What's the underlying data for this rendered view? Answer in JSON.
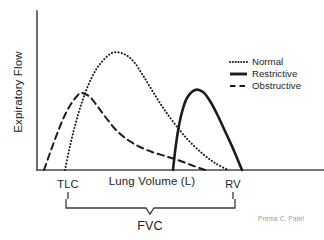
{
  "chart_data": {
    "type": "line",
    "title": "",
    "xlabel": "Lung Volume (L)",
    "ylabel": "Expiratory Flow",
    "grid": false,
    "legend_position": "top-right",
    "axis_tick_labels": [],
    "series": [
      {
        "name": "Normal",
        "style": "dotted",
        "color": "#1b1b1b",
        "points": [
          [
            65,
            170
          ],
          [
            70,
            146
          ],
          [
            76,
            122
          ],
          [
            83,
            99
          ],
          [
            91,
            79
          ],
          [
            100,
            64
          ],
          [
            112,
            53
          ],
          [
            124,
            54
          ],
          [
            134,
            62
          ],
          [
            144,
            77
          ],
          [
            155,
            95
          ],
          [
            166,
            112
          ],
          [
            178,
            128
          ],
          [
            190,
            142
          ],
          [
            203,
            154
          ],
          [
            215,
            163
          ],
          [
            228,
            170
          ]
        ]
      },
      {
        "name": "Restrictive",
        "style": "solid",
        "color": "#1b1b1b",
        "points": [
          [
            173,
            170
          ],
          [
            175,
            152
          ],
          [
            178,
            131
          ],
          [
            182,
            112
          ],
          [
            187,
            98
          ],
          [
            195,
            90
          ],
          [
            203,
            92
          ],
          [
            210,
            101
          ],
          [
            217,
            114
          ],
          [
            224,
            129
          ],
          [
            231,
            144
          ],
          [
            237,
            158
          ],
          [
            242,
            170
          ]
        ]
      },
      {
        "name": "Obstructive",
        "style": "dashed",
        "color": "#1b1b1b",
        "points": [
          [
            44,
            170
          ],
          [
            50,
            153
          ],
          [
            57,
            134
          ],
          [
            64,
            117
          ],
          [
            71,
            104
          ],
          [
            78,
            95
          ],
          [
            82,
            93
          ],
          [
            90,
            97
          ],
          [
            98,
            107
          ],
          [
            107,
            119
          ],
          [
            117,
            131
          ],
          [
            128,
            140
          ],
          [
            140,
            147
          ],
          [
            152,
            152
          ],
          [
            165,
            156
          ],
          [
            178,
            160
          ],
          [
            191,
            165
          ],
          [
            205,
            170
          ]
        ]
      }
    ],
    "markers": [
      {
        "label": "TLC",
        "x": 68
      },
      {
        "label": "RV",
        "x": 233
      }
    ],
    "brace": {
      "label": "FVC",
      "left_x": 66,
      "right_x": 235,
      "center_x": 150
    },
    "axes": {
      "y_axis_x": 37,
      "y_axis_top": 11,
      "baseline_y": 170,
      "baseline_right": 324
    }
  },
  "legend": {
    "items": [
      {
        "label": "Normal",
        "style": "dotted"
      },
      {
        "label": "Restrictive",
        "style": "solid"
      },
      {
        "label": "Obstructive",
        "style": "dashed"
      }
    ]
  },
  "credit": {
    "text": "Prema C. Patel"
  }
}
